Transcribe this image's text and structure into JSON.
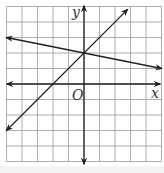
{
  "chart_data": {
    "type": "line",
    "title": "",
    "xlabel": "x",
    "ylabel": "y",
    "origin_label": "O",
    "grid": true,
    "xlim": [
      -5,
      5
    ],
    "ylim": [
      -5,
      5
    ],
    "tick_labels": false,
    "series": [
      {
        "name": "line-1",
        "equation": "y = x + 2",
        "slope": 1,
        "y_intercept": 2,
        "x": [
          -5,
          2.8
        ],
        "y": [
          -3,
          4.8
        ]
      },
      {
        "name": "line-2",
        "equation": "y = -x/5 + 2",
        "slope": -0.2,
        "y_intercept": 2,
        "x": [
          -5,
          5
        ],
        "y": [
          3,
          1
        ]
      }
    ],
    "intersection": [
      0,
      2
    ]
  },
  "labels": {
    "x_axis": "x",
    "y_axis": "y",
    "origin": "O"
  },
  "colors": {
    "grid": "#9a9a9a",
    "axis": "#222222",
    "line": "#222222",
    "background": "#ffffff"
  }
}
